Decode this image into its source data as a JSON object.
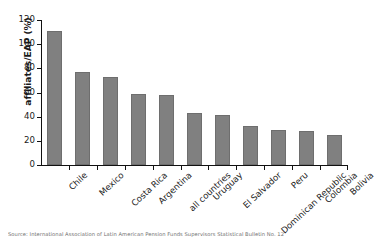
{
  "chart_data": {
    "type": "bar",
    "title": "",
    "xlabel": "",
    "ylabel": "affiliates/EAP (%)",
    "ylim": [
      0,
      120
    ],
    "yticks": [
      0,
      20,
      40,
      60,
      80,
      100,
      120
    ],
    "grid": false,
    "legend": null,
    "bar_color": "#808080",
    "categories": [
      "Chile",
      "Mexico",
      "Costa Rica",
      "Argentina",
      "all countries",
      "Uruguay",
      "El Salvador",
      "Dominican Republic",
      "Peru",
      "Colombia",
      "Bolivia"
    ],
    "values": [
      111,
      77,
      73,
      59,
      58,
      43,
      41,
      32,
      29,
      28,
      24.5
    ]
  },
  "caption": "Source: International Association of Latin American Pension Funds Supervisors Statistical Bulletin No. 12"
}
